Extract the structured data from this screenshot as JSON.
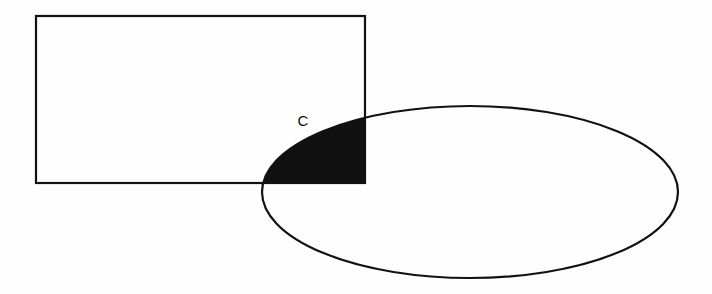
{
  "figure": {
    "background_color": "#fefefe",
    "stroke_color": "#111111",
    "fill_color": "#111111",
    "stroke_width": 2.2,
    "canvas": {
      "width": 712,
      "height": 294
    }
  },
  "shapes": {
    "rectangle": {
      "name": "rectangle-set",
      "x": 36,
      "y": 16,
      "width": 329,
      "height": 167,
      "right": 365,
      "bottom": 183,
      "fill": "none",
      "stroke": "#111111"
    },
    "ellipse": {
      "name": "ellipse-set",
      "cx": 470,
      "cy": 192,
      "rx": 208,
      "ry": 86,
      "left": 262,
      "right": 678,
      "top": 106,
      "bottom": 278,
      "fill": "none",
      "stroke": "#111111"
    }
  },
  "intersection": {
    "name": "shaded-intersection",
    "label": "C",
    "label_x": 303,
    "label_y": 122,
    "fill": "#111111",
    "description": "Region common to the rectangle and the ellipse, filled solid black",
    "vertex_left": {
      "x": 262,
      "y": 190
    },
    "vertex_top_right": {
      "x": 365,
      "y": 120
    },
    "vertex_bottom_right": {
      "x": 365,
      "y": 183
    }
  },
  "labels": [
    {
      "id": "intersection-label",
      "text": "C",
      "x": 303,
      "y": 122
    }
  ]
}
